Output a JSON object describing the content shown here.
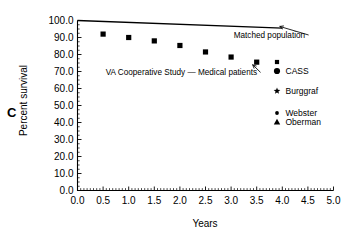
{
  "panel": {
    "label": "C"
  },
  "chart_data": {
    "type": "scatter",
    "title": "",
    "xlabel": "Years",
    "ylabel": "Percent survival",
    "xlim": [
      0.0,
      5.0
    ],
    "ylim": [
      0.0,
      100.0
    ],
    "xticks": [
      "0.0",
      "0.5",
      "1.0",
      "1.5",
      "2.0",
      "2.5",
      "3.0",
      "3.5",
      "4.0",
      "4.5",
      "5.0"
    ],
    "xtick_values": [
      0.0,
      0.5,
      1.0,
      1.5,
      2.0,
      2.5,
      3.0,
      3.5,
      4.0,
      4.5,
      5.0
    ],
    "yticks": [
      "0.0",
      "10.0",
      "20.0",
      "30.0",
      "40.0",
      "50.0",
      "60.0",
      "70.0",
      "80.0",
      "90.0",
      "100.0"
    ],
    "ytick_values": [
      0,
      10,
      20,
      30,
      40,
      50,
      60,
      70,
      80,
      90,
      100
    ],
    "grid": false,
    "legend_position": "outside-right",
    "series": [
      {
        "name": "Matched population",
        "marker": "line",
        "style": "solid-line",
        "x": [
          0.0,
          4.0
        ],
        "values": [
          100.0,
          95.5
        ]
      },
      {
        "name": "VA Cooperative Study — Medical patients",
        "marker": "square",
        "style": "filled-square",
        "x": [
          0.5,
          1.0,
          1.5,
          2.0,
          2.5,
          3.0,
          3.5
        ],
        "values": [
          92.0,
          90.0,
          88.0,
          85.3,
          81.5,
          78.5,
          75.5
        ]
      }
    ],
    "annotations": [
      {
        "text": "Matched population",
        "x": 3.05,
        "y": 90.0,
        "arrow_to_x": 3.95,
        "arrow_to_y": 96.5
      },
      {
        "text": "VA Cooperative Study — Medical patients",
        "x": 0.55,
        "y": 68.0,
        "arrow_to_x": 3.42,
        "arrow_to_y": 74.0
      }
    ],
    "legend": [
      {
        "label": "CASS",
        "marker": "square-small",
        "group": 0
      },
      {
        "label": "CASS",
        "marker": "circle-large",
        "group": 0
      },
      {
        "label": "Burggraf",
        "marker": "star",
        "group": 1
      },
      {
        "label": "Webster",
        "marker": "circle-small",
        "group": 2
      },
      {
        "label": "Oberman",
        "marker": "triangle",
        "group": 2
      }
    ],
    "colors": {
      "ink": "#000000",
      "background": "#ffffff"
    }
  }
}
